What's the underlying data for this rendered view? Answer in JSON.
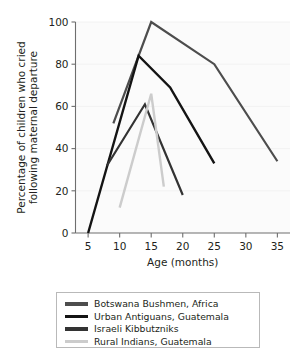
{
  "chart_data": {
    "type": "line",
    "title": "",
    "xlabel": "Age (months)",
    "ylabel": "Percentage of children who cried following maternal departure",
    "xlim": [
      3,
      37
    ],
    "ylim": [
      0,
      100
    ],
    "xticks": [
      5,
      10,
      15,
      20,
      25,
      30,
      35
    ],
    "xtick_labels": [
      "5",
      "10",
      "15",
      "20",
      "25",
      "30",
      "35"
    ],
    "yticks": [
      0,
      20,
      40,
      60,
      80,
      100
    ],
    "ytick_labels": [
      "0",
      "20",
      "40",
      "60",
      "80",
      "100"
    ],
    "grid": false,
    "legend_position": "below-center",
    "series": [
      {
        "name": "Botswana Bushmen, Africa",
        "color": "#4d4d4d",
        "linewidth": 2.2,
        "x": [
          9,
          15,
          25,
          35
        ],
        "y": [
          52,
          100,
          80,
          34
        ]
      },
      {
        "name": "Urban Antiguans, Guatemala",
        "color": "#141414",
        "linewidth": 2.4,
        "x": [
          5,
          13,
          18,
          25
        ],
        "y": [
          0,
          84,
          69,
          33
        ]
      },
      {
        "name": "Israeli Kibbutzniks",
        "color": "#333333",
        "linewidth": 2.2,
        "x": [
          8,
          14,
          20
        ],
        "y": [
          32,
          61,
          18
        ]
      },
      {
        "name": "Rural Indians, Guatemala",
        "color": "#cccccc",
        "linewidth": 2.4,
        "x": [
          10,
          15,
          17
        ],
        "y": [
          12,
          66,
          22
        ]
      }
    ]
  },
  "legend": {
    "items": [
      {
        "label": "Botswana Bushmen, Africa",
        "color": "#4d4d4d"
      },
      {
        "label": "Urban Antiguans, Guatemala",
        "color": "#141414"
      },
      {
        "label": "Israeli Kibbutzniks",
        "color": "#333333"
      },
      {
        "label": "Rural Indians, Guatemala",
        "color": "#cccccc"
      }
    ]
  },
  "axes": {
    "x_title": "Age (months)",
    "y_title_line1": "Percentage of children who cried",
    "y_title_line2": "following maternal departure"
  }
}
